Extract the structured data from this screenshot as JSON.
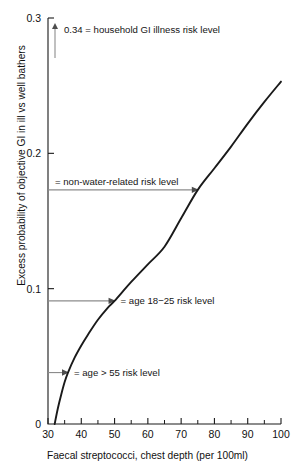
{
  "chart_data": {
    "type": "line",
    "title": "",
    "xlabel": "Faecal streptococci, chest depth (per 100ml)",
    "ylabel": "Excess probability of objective GI in ill vs well bathers",
    "xlim": [
      30,
      100
    ],
    "ylim": [
      0,
      0.3
    ],
    "grid": false,
    "legend": "none",
    "xticks": [
      30,
      40,
      50,
      60,
      70,
      80,
      90,
      100
    ],
    "xtick_labels": [
      "30",
      "40",
      "50",
      "60",
      "70",
      "80",
      "90",
      "100"
    ],
    "xticks_minor": [
      35,
      45,
      55,
      65,
      75,
      85,
      95
    ],
    "yticks": [
      0,
      0.1,
      0.2,
      0.3
    ],
    "ytick_labels": [
      "0",
      "0.1",
      "0.2",
      "0.3"
    ],
    "series": [
      {
        "name": "Excess probability of objective GI",
        "x": [
          32,
          33,
          34,
          35,
          36,
          38,
          40,
          42,
          45,
          48,
          50,
          55,
          60,
          65,
          70,
          75,
          80,
          85,
          90,
          95,
          100
        ],
        "y": [
          0.0,
          0.012,
          0.022,
          0.031,
          0.038,
          0.049,
          0.058,
          0.066,
          0.077,
          0.086,
          0.091,
          0.105,
          0.118,
          0.131,
          0.152,
          0.173,
          0.189,
          0.205,
          0.222,
          0.238,
          0.253
        ]
      }
    ],
    "annotations": [
      {
        "id": "household-gi-illness",
        "label": "0.34 = household GI illness risk level",
        "value": 0.34,
        "marker": "up-arrow-off-scale",
        "x_data": 32,
        "note": "value above plotted y-range, indicated by vertical arrow at left"
      },
      {
        "id": "non-water-related",
        "label": "= non-water-related risk level",
        "value": 0.173,
        "marker": "right-arrow-to-curve",
        "x_data": 75
      },
      {
        "id": "age-18-25",
        "label": "= age 18−25 risk level",
        "value": 0.091,
        "marker": "right-arrow-to-curve",
        "x_data": 50
      },
      {
        "id": "age-over-55",
        "label": "= age > 55 risk level",
        "value": 0.038,
        "marker": "right-arrow-to-curve",
        "x_data": 36
      }
    ],
    "colors": {
      "curve": "#1a1a1a",
      "axis": "#1a1a1a",
      "annotation_line": "#8c8c8c",
      "background": "#ffffff"
    }
  }
}
